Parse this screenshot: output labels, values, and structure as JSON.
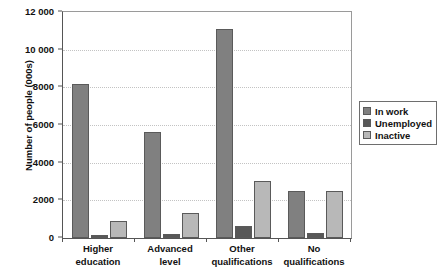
{
  "chart_data": {
    "type": "bar",
    "title": "",
    "subtitle": "",
    "xlabel": "",
    "ylabel": "Number of people (000s)",
    "ylim": [
      0,
      12000
    ],
    "ytick_labels": [
      "12 000",
      "10 000",
      "8000",
      "6000",
      "4000",
      "2000",
      "0"
    ],
    "ytick_values": [
      12000,
      10000,
      8000,
      6000,
      4000,
      2000,
      0
    ],
    "grid": "horizontal-dotted",
    "legend_position": "right-outside",
    "categories": [
      "Higher education",
      "Advanced level",
      "Other qualifications",
      "No qualifications"
    ],
    "category_lines": [
      [
        "Higher",
        "education"
      ],
      [
        "Advanced",
        "level"
      ],
      [
        "Other",
        "qualifications"
      ],
      [
        "No",
        "qualifications"
      ]
    ],
    "series": [
      {
        "name": "In work",
        "color": "#808080",
        "values": [
          8200,
          5650,
          11100,
          2520
        ]
      },
      {
        "name": "Unemployed",
        "color": "#585858",
        "values": [
          180,
          230,
          630,
          280
        ]
      },
      {
        "name": "Inactive",
        "color": "#b8b8b8",
        "values": [
          930,
          1340,
          3040,
          2500
        ]
      }
    ]
  },
  "legend": {
    "items": [
      {
        "label": "In work",
        "color": "#808080"
      },
      {
        "label": "Unemployed",
        "color": "#585858"
      },
      {
        "label": "Inactive",
        "color": "#b8b8b8"
      }
    ]
  },
  "colors": {
    "in_work": "#808080",
    "unemployed": "#585858",
    "inactive": "#b8b8b8",
    "axis": "#555555",
    "grid": "#c3c3c3",
    "background": "#ffffff"
  }
}
